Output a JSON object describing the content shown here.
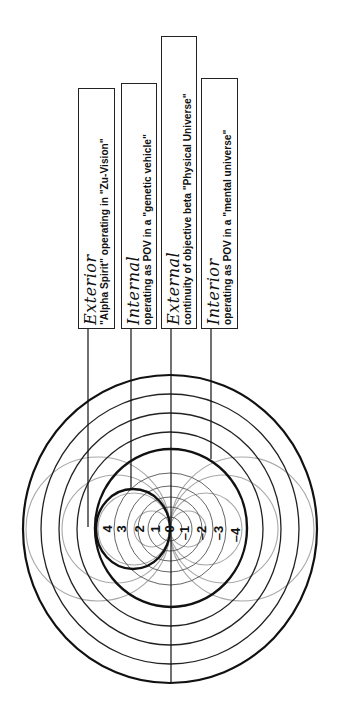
{
  "diagram": {
    "orientation": "rotated 90 degrees counter-clockwise",
    "labels": [
      {
        "title": "Exterior",
        "description": "\"Alpha Spirit\" operating in \"Zu-Vision\""
      },
      {
        "title": "Internal",
        "description": "operating as POV in a \"genetic vehicle\""
      },
      {
        "title": "External",
        "description": "continuity of objective beta \"Physical Universe\""
      },
      {
        "title": "Interior",
        "description": "operating as POV in a \"mental universe\""
      }
    ],
    "scale": {
      "positive": [
        "4",
        "3",
        "2",
        "1"
      ],
      "zero": "0",
      "negative": [
        "–1",
        "–2",
        "–3",
        "–4"
      ]
    },
    "colors": {
      "line": "#111111",
      "thin_ring": "#333333",
      "grey_circles": "#a8a8a8",
      "background": "#ffffff"
    }
  }
}
